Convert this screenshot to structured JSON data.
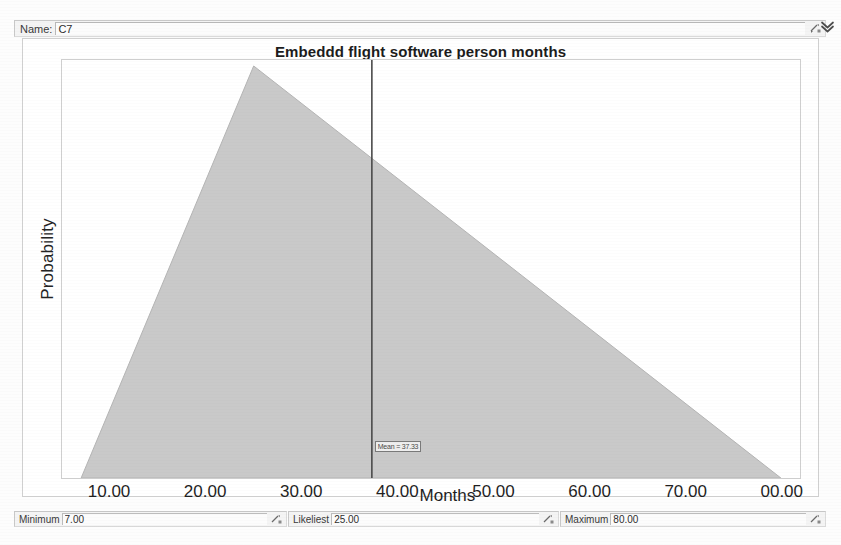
{
  "window": {
    "name_label": "Name:",
    "name_value": "C7",
    "resize_icon": "resize-arrow-icon",
    "expand_icon": "double-chevron-down-icon"
  },
  "chart": {
    "title": "Embeddd flight software person months",
    "marker_label": "Mean = 37.33"
  },
  "chart_data": {
    "type": "area",
    "title": "Embeddd flight software person months",
    "xlabel": "Months",
    "ylabel": "Probability",
    "distribution": "triangular",
    "minimum": 7.0,
    "likeliest": 25.0,
    "maximum": 80.0,
    "mean": 37.33,
    "xlim": [
      5.0,
      82.0
    ],
    "ylim": [
      0,
      1
    ],
    "grid": false,
    "legend": "none",
    "xticks": [
      10.0,
      20.0,
      30.0,
      40.0,
      50.0,
      60.0,
      70.0,
      80.0
    ],
    "xtick_labels": [
      "10.00",
      "20.00",
      "30.00",
      "40.00",
      "50.00",
      "60.00",
      "70.00",
      "00.00"
    ],
    "x": [
      7.0,
      25.0,
      80.0
    ],
    "values": [
      0.0,
      1.0,
      0.0
    ],
    "annotations": [
      {
        "type": "vline",
        "x": 37.33,
        "label": "Mean = 37.33"
      }
    ]
  },
  "params": {
    "minimum": {
      "label": "Minimum",
      "value": "7.00",
      "icon": "resize-arrow-icon"
    },
    "likeliest": {
      "label": "Likeliest",
      "value": "25.00",
      "icon": "resize-arrow-icon"
    },
    "maximum": {
      "label": "Maximum",
      "value": "80.00",
      "icon": "resize-arrow-icon"
    }
  },
  "colors": {
    "fill": "#c9c9c9",
    "line": "#4a4a4a",
    "frame": "#cfcfcf",
    "text": "#1f1f1f"
  }
}
